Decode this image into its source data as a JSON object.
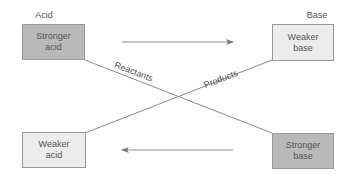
{
  "headers": {
    "acid": "Acid",
    "base": "Base"
  },
  "boxes": {
    "top_left": {
      "text": "Stronger\nacid",
      "strength": "stronger"
    },
    "top_right": {
      "text": "Weaker\nbase",
      "strength": "weaker"
    },
    "bottom_left": {
      "text": "Weaker\nacid",
      "strength": "weaker"
    },
    "bottom_right": {
      "text": "Stronger\nbase",
      "strength": "stronger"
    }
  },
  "line_labels": {
    "reactants": "Reactants",
    "products": "Products"
  },
  "arrows": {
    "top": "right",
    "bottom": "left"
  },
  "colors": {
    "stronger_fill": "#b9b9b9",
    "weaker_fill": "#ececec",
    "line": "#8a8a8a"
  }
}
